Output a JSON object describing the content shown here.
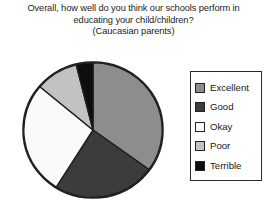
{
  "title": {
    "line1": "Overall, how well do you think our schools perform in",
    "line2": "educating your child/children?",
    "line3": "(Caucasian parents)"
  },
  "legend": {
    "position": "right",
    "items": [
      {
        "label": "Excellent",
        "color": "#8d8d8d"
      },
      {
        "label": "Good",
        "color": "#3c3c3c"
      },
      {
        "label": "Okay",
        "color": "#fafafa"
      },
      {
        "label": "Poor",
        "color": "#c2c2c2"
      },
      {
        "label": "Terrible",
        "color": "#0d0d0d"
      }
    ]
  },
  "chart_data": {
    "type": "pie",
    "title": "Overall, how well do you think our schools perform in educating your child/children? (Caucasian parents)",
    "subtitle": "(Caucasian parents)",
    "xlabel": "",
    "ylabel": "",
    "grid": false,
    "legend_position": "right",
    "start_angle_deg": 0,
    "direction": "clockwise",
    "categories": [
      "Excellent",
      "Good",
      "Okay",
      "Poor",
      "Terrible"
    ],
    "values": [
      35,
      24,
      27,
      10,
      4
    ],
    "colors": [
      "#8d8d8d",
      "#3c3c3c",
      "#fafafa",
      "#c2c2c2",
      "#0d0d0d"
    ],
    "slices": [
      {
        "label": "Excellent",
        "value": 35,
        "start_deg": 0,
        "end_deg": 126,
        "color": "#8d8d8d"
      },
      {
        "label": "Good",
        "value": 24,
        "start_deg": 126,
        "end_deg": 212,
        "color": "#3c3c3c"
      },
      {
        "label": "Okay",
        "value": 27,
        "start_deg": 212,
        "end_deg": 310,
        "color": "#fafafa"
      },
      {
        "label": "Poor",
        "value": 10,
        "start_deg": 310,
        "end_deg": 346,
        "color": "#c2c2c2"
      },
      {
        "label": "Terrible",
        "value": 4,
        "start_deg": 346,
        "end_deg": 360,
        "color": "#0d0d0d"
      }
    ]
  }
}
